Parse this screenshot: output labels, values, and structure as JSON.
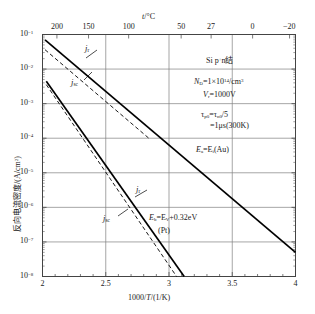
{
  "chart_data": {
    "type": "line",
    "title": "",
    "xlabel": "1000/T/(1/K)",
    "ylabel": "反向电流密度/(A/cm2)",
    "top_axis_label": "t/°C",
    "xlim": [
      2,
      4
    ],
    "ylim_log": [
      -8,
      -1
    ],
    "xticks": [
      "2",
      "2.5",
      "3",
      "3.5",
      "4"
    ],
    "xtick_values": [
      2,
      2.5,
      3,
      3.5,
      4
    ],
    "yticks": [
      "-1",
      "-2",
      "-3",
      "-4",
      "-5",
      "-6",
      "-7",
      "-8"
    ],
    "ytick_values": [
      -1,
      -2,
      -3,
      -4,
      -5,
      -6,
      -7,
      -8
    ],
    "top_ticks": [
      "200",
      "150",
      "100",
      "50",
      "27",
      "0",
      "-20"
    ],
    "top_tick_x": [
      2.114,
      2.364,
      2.681,
      3.096,
      3.333,
      3.661,
      3.953
    ],
    "grid": true,
    "legend_position": "none",
    "series": [
      {
        "name": "j_r (Au)",
        "style": "solid",
        "label": "j",
        "label_sub": "r",
        "points": [
          [
            2.02,
            -1.155
          ],
          [
            4.0,
            -7.3
          ]
        ]
      },
      {
        "name": "j_sc (Au)",
        "style": "dashed",
        "label": "j",
        "label_sub": "sc",
        "points": [
          [
            2.02,
            -1.44
          ],
          [
            2.52,
            -3.0
          ],
          [
            2.85,
            -4.03
          ]
        ]
      },
      {
        "name": "j_r (Pt)",
        "style": "solid",
        "label": "j",
        "label_sub": "r",
        "points": [
          [
            2.03,
            -2.35
          ],
          [
            3.12,
            -8.0
          ]
        ]
      },
      {
        "name": "j_sc (Pt)",
        "style": "dashed",
        "label": "j",
        "label_sub": "sc",
        "points": [
          [
            2.03,
            -2.45
          ],
          [
            3.06,
            -8.0
          ]
        ]
      }
    ],
    "annotations": [
      {
        "name": "device-note",
        "text": "Si  p+n结"
      },
      {
        "name": "doping-note",
        "text": "ND=1×1014/cm3"
      },
      {
        "name": "voltage-note",
        "text": "Vr=1000V"
      },
      {
        "name": "lifetime-note-1",
        "text": "τp0=τn0/5"
      },
      {
        "name": "lifetime-note-2",
        "text": "=1μs(300K)"
      },
      {
        "name": "au-level-note",
        "text": "Ea=Ei(Au)"
      },
      {
        "name": "pt-level-note",
        "text": "Eb=EV+0.32eV"
      },
      {
        "name": "pt-note",
        "text": "(Pt)"
      }
    ]
  },
  "axes": {
    "y_title_main": "反向电流密度/(A/cm",
    "y_title_sup": "2",
    "y_title_tail": ")",
    "x_title_a": "1000/",
    "x_title_b": "T",
    "x_title_c": "/(1/K)",
    "top_title_a": "t",
    "top_title_b": "/°C",
    "y_mantissa": "10"
  },
  "annotations": {
    "device": {
      "a": "Si  p",
      "sup": "+",
      "b": "n结"
    },
    "doping": {
      "n": "N",
      "sub": "D",
      "eq": "=1×10",
      "exp": "14",
      "unit": "/cm",
      "unit_exp": "3"
    },
    "voltage": {
      "v": "V",
      "sub": "r",
      "val": "=1000V"
    },
    "lifetime1": {
      "t1": "τ",
      "s1": "p0",
      "eq": "=τ",
      "s2": "n0",
      "tail": "/5"
    },
    "lifetime2": {
      "text": "=1μs(300K)"
    },
    "au": {
      "e": "E",
      "sub": "a",
      "eq": "=E",
      "sub2": "i",
      "tail": "(Au)"
    },
    "pt": {
      "e": "E",
      "sub": "b",
      "eq": "=E",
      "sub2": "V",
      "tail": "+0.32eV"
    },
    "pt2": {
      "text": "(Pt)"
    }
  },
  "colors": {
    "curve": "#000000",
    "grid": "#808080",
    "frame": "#444444",
    "background": "#ffffff"
  }
}
